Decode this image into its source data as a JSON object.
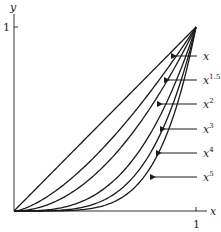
{
  "chart_data": {
    "type": "line",
    "title": "",
    "xlabel": "x",
    "ylabel": "y",
    "xlim": [
      0,
      1
    ],
    "ylim": [
      0,
      1
    ],
    "x_ticks": [
      "1"
    ],
    "y_ticks": [
      "1"
    ],
    "grid": false,
    "legend_position": "right, arrow annotations",
    "series": [
      {
        "name": "x",
        "exponent": 1,
        "label": "x",
        "sup": "",
        "x": [
          0,
          0.25,
          0.5,
          0.75,
          1
        ],
        "values": [
          0,
          0.25,
          0.5,
          0.75,
          1
        ]
      },
      {
        "name": "x^1.5",
        "exponent": 1.5,
        "label": "x",
        "sup": "1.5",
        "x": [
          0,
          0.25,
          0.5,
          0.75,
          1
        ],
        "values": [
          0,
          0.125,
          0.354,
          0.65,
          1
        ]
      },
      {
        "name": "x^2",
        "exponent": 2,
        "label": "x",
        "sup": "2",
        "x": [
          0,
          0.25,
          0.5,
          0.75,
          1
        ],
        "values": [
          0,
          0.0625,
          0.25,
          0.5625,
          1
        ]
      },
      {
        "name": "x^3",
        "exponent": 3,
        "label": "x",
        "sup": "3",
        "x": [
          0,
          0.25,
          0.5,
          0.75,
          1
        ],
        "values": [
          0,
          0.0156,
          0.125,
          0.4219,
          1
        ]
      },
      {
        "name": "x^4",
        "exponent": 4,
        "label": "x",
        "sup": "4",
        "x": [
          0,
          0.25,
          0.5,
          0.75,
          1
        ],
        "values": [
          0,
          0.0039,
          0.0625,
          0.3164,
          1
        ]
      },
      {
        "name": "x^5",
        "exponent": 5,
        "label": "x",
        "sup": "5",
        "x": [
          0,
          0.25,
          0.5,
          0.75,
          1
        ],
        "values": [
          0,
          0.001,
          0.0313,
          0.2373,
          1
        ]
      }
    ],
    "annotations": [
      {
        "text": "x",
        "sup": "",
        "y_px": 56,
        "arrow_to_x_px": 172
      },
      {
        "text": "x",
        "sup": "1.5",
        "y_px": 80,
        "arrow_to_x_px": 165
      },
      {
        "text": "x",
        "sup": "2",
        "y_px": 104,
        "arrow_to_x_px": 158
      },
      {
        "text": "x",
        "sup": "3",
        "y_px": 129,
        "arrow_to_x_px": 161
      },
      {
        "text": "x",
        "sup": "4",
        "y_px": 153,
        "arrow_to_x_px": 157
      },
      {
        "text": "x",
        "sup": "5",
        "y_px": 177,
        "arrow_to_x_px": 151
      }
    ]
  },
  "colors": {
    "curve": "#1a1a1a",
    "axis": "#333333",
    "text": "#222222",
    "background": "#ffffff"
  }
}
